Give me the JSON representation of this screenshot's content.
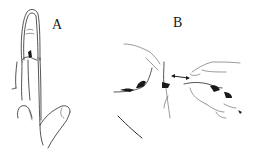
{
  "figure": {
    "panels": [
      {
        "id": "A",
        "label": "A",
        "content": "finger-splint-illustration"
      },
      {
        "id": "B",
        "label": "B",
        "content": "hand-manipulation-illustration-with-double-arrow"
      }
    ],
    "colors": {
      "background": "#ffffff",
      "ink": "#1a1a1a"
    }
  }
}
